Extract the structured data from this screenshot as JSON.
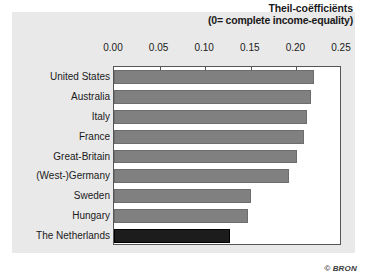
{
  "credit": "© BRON",
  "chart_data": {
    "type": "bar",
    "orientation": "horizontal",
    "title": "Theil-coëfficiënts",
    "subtitle": "(0= complete income-equality)",
    "xlabel": "",
    "ylabel": "",
    "xlim": [
      0.0,
      0.25
    ],
    "grid": false,
    "legend": "none",
    "xticks": [
      0.0,
      0.05,
      0.1,
      0.15,
      0.2,
      0.25
    ],
    "xtick_labels": [
      "0.00",
      "0.05",
      "0.10",
      "0.15",
      "0.20",
      "0.25"
    ],
    "categories": [
      "United States",
      "Australia",
      "Italy",
      "France",
      "Great-Britain",
      "(West-)Germany",
      "Sweden",
      "Hungary",
      "The Netherlands"
    ],
    "values": [
      0.219,
      0.216,
      0.212,
      0.208,
      0.201,
      0.192,
      0.15,
      0.147,
      0.127
    ],
    "bar_colors": [
      "#808080",
      "#808080",
      "#808080",
      "#808080",
      "#808080",
      "#808080",
      "#808080",
      "#808080",
      "#1c1c1c"
    ],
    "highlight_category": "The Netherlands",
    "colors": {
      "bar": "#808080",
      "bar_highlight": "#1c1c1c",
      "panel_background": "#e9e9e9",
      "plot_background": "#ffffff",
      "axis": "#555555",
      "text": "#1a1a1a"
    }
  }
}
